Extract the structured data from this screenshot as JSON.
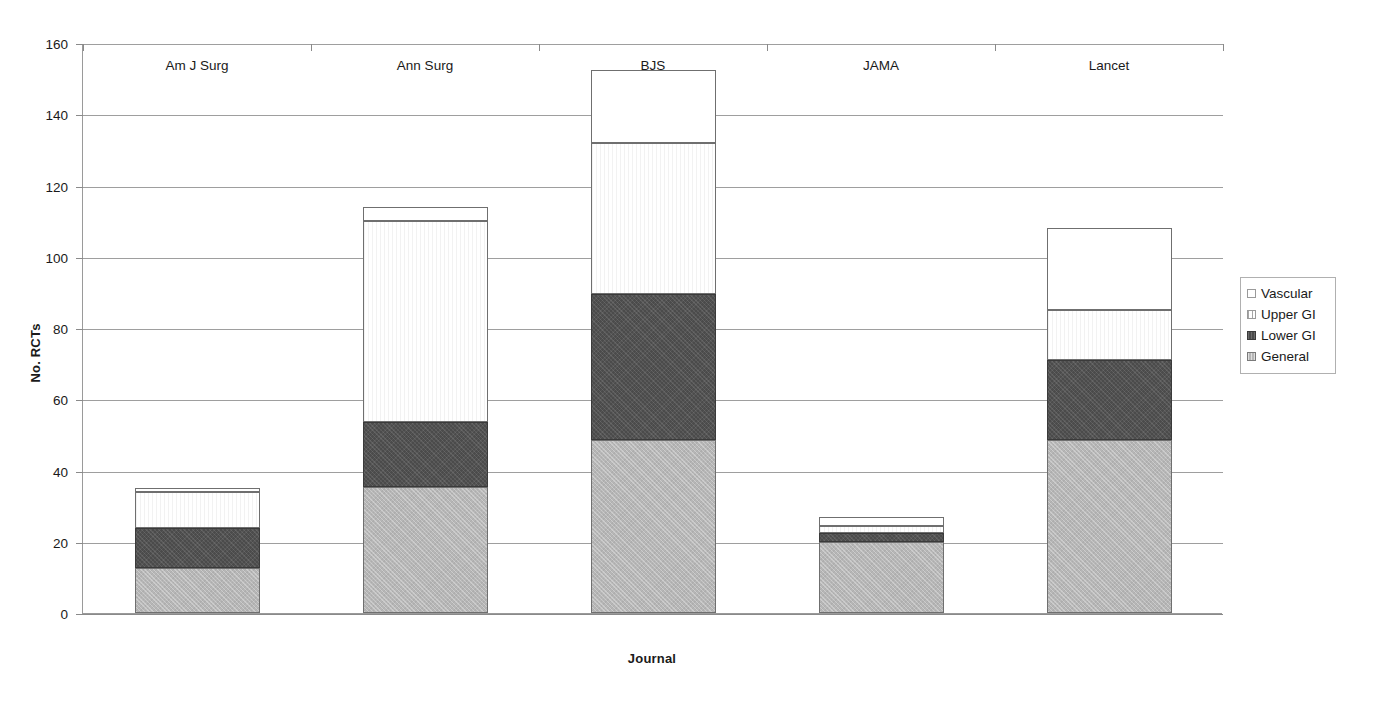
{
  "chart_data": {
    "type": "bar",
    "title": "",
    "subtitle": "",
    "xlabel": "Journal",
    "ylabel": "No. RCTs",
    "ylim": [
      0,
      160
    ],
    "ytick_step": 20,
    "yticks": [
      "0",
      "20",
      "40",
      "60",
      "80",
      "100",
      "120",
      "140",
      "160"
    ],
    "grid": true,
    "stacked": true,
    "legend_position": "right",
    "categories": [
      "Am J Surg",
      "Ann Surg",
      "BJS",
      "JAMA",
      "Lancet"
    ],
    "series": [
      {
        "name": "General",
        "color": "#b6b6b6",
        "values": [
          12.5,
          35.5,
          48.5,
          20,
          48.5
        ]
      },
      {
        "name": "Lower GI",
        "color": "#4b4b4b",
        "values": [
          11.5,
          18,
          41,
          2.5,
          22.5
        ]
      },
      {
        "name": "Upper GI",
        "color": "#ffffff",
        "values": [
          10,
          56.5,
          42.5,
          2,
          14
        ]
      },
      {
        "name": "Vascular",
        "color": "#ffffff",
        "values": [
          1,
          4,
          20.5,
          2.5,
          23
        ]
      }
    ],
    "cumulative_tops": {
      "Am J Surg": [
        12.5,
        24,
        34,
        35
      ],
      "Ann Surg": [
        35.5,
        53.5,
        110,
        114
      ],
      "BJS": [
        48.5,
        89.5,
        132,
        152.5
      ],
      "JAMA": [
        20,
        22.5,
        24.5,
        27
      ],
      "Lancet": [
        48.5,
        71,
        85,
        108
      ]
    },
    "totals": [
      35,
      114,
      152.5,
      27,
      108
    ]
  },
  "legend": {
    "entries": [
      {
        "label": "Vascular",
        "swatch": "vascular"
      },
      {
        "label": "Upper GI",
        "swatch": "uppergi"
      },
      {
        "label": "Lower GI",
        "swatch": "lowergi"
      },
      {
        "label": "General",
        "swatch": "general"
      }
    ]
  },
  "axes": {
    "y_title": "No. RCTs",
    "x_title": "Journal"
  }
}
